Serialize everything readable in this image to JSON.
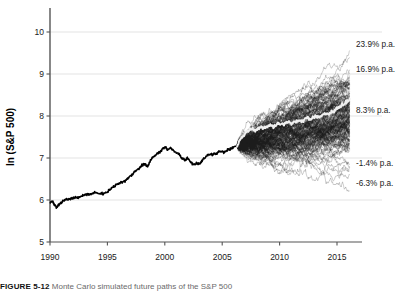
{
  "figure": {
    "caption_label": "FIGURE 5-12",
    "caption_text": "Monte Carlo simulated future paths of the S&P 500",
    "background_color": "#ffffff"
  },
  "chart_data": {
    "type": "line",
    "title": "",
    "subtitle": "",
    "xlabel": "",
    "ylabel": "ln (S&P 500)",
    "xlim": [
      1989.2,
      2016.6
    ],
    "ylim": [
      5,
      10.35
    ],
    "grid": true,
    "grid_axis": "y",
    "legend_position": "none",
    "yticks": [
      5,
      6,
      7,
      8,
      9,
      10
    ],
    "ytick_labels": [
      "5",
      "6",
      "7",
      "8",
      "9",
      "10"
    ],
    "xticks": [
      1990,
      1995,
      2000,
      2005,
      2010,
      2015
    ],
    "xtick_labels": [
      "1990",
      "1995",
      "2000",
      "2005",
      "2010",
      "2015"
    ],
    "colors": {
      "historical_line": "#000000",
      "simulation_path": "#1d1d1d",
      "median_path": "#efefef",
      "grid": "#dcdcdc",
      "axis": "#555555",
      "text": "#1a1a1a"
    },
    "series": [
      {
        "name": "Historical ln(S&P 500)",
        "kind": "historical",
        "color": "#000000",
        "line_width": 1.6,
        "x_start": 1990.0,
        "x_end": 2006.3,
        "x": [
          1990.0,
          1990.2,
          1990.4,
          1990.6,
          1990.8,
          1991.0,
          1991.25,
          1991.5,
          1991.75,
          1992.0,
          1992.25,
          1992.5,
          1992.75,
          1993.0,
          1993.25,
          1993.5,
          1993.75,
          1994.0,
          1994.25,
          1994.5,
          1994.75,
          1995.0,
          1995.25,
          1995.5,
          1995.75,
          1996.0,
          1996.25,
          1996.5,
          1996.75,
          1997.0,
          1997.25,
          1997.5,
          1997.75,
          1998.0,
          1998.25,
          1998.5,
          1998.75,
          1999.0,
          1999.25,
          1999.5,
          1999.75,
          2000.0,
          2000.25,
          2000.5,
          2000.75,
          2001.0,
          2001.25,
          2001.5,
          2001.75,
          2002.0,
          2002.25,
          2002.5,
          2002.75,
          2003.0,
          2003.25,
          2003.5,
          2003.75,
          2004.0,
          2004.25,
          2004.5,
          2004.75,
          2005.0,
          2005.25,
          2005.5,
          2005.75,
          2006.0,
          2006.3
        ],
        "y": [
          5.93,
          5.96,
          5.88,
          5.83,
          5.9,
          5.95,
          5.99,
          6.01,
          6.02,
          6.05,
          6.07,
          6.06,
          6.09,
          6.11,
          6.13,
          6.14,
          6.16,
          6.17,
          6.15,
          6.16,
          6.15,
          6.2,
          6.26,
          6.31,
          6.35,
          6.39,
          6.42,
          6.44,
          6.5,
          6.56,
          6.63,
          6.72,
          6.74,
          6.82,
          6.86,
          6.8,
          6.94,
          7.02,
          7.09,
          7.12,
          7.2,
          7.26,
          7.21,
          7.24,
          7.18,
          7.13,
          7.09,
          7.0,
          6.94,
          7.0,
          6.9,
          6.83,
          6.87,
          6.85,
          6.94,
          7.01,
          7.07,
          7.09,
          7.08,
          7.1,
          7.15,
          7.16,
          7.15,
          7.19,
          7.22,
          7.26,
          7.3
        ]
      },
      {
        "name": "Monte Carlo simulated paths",
        "kind": "simulation_fan",
        "color": "#1d1d1d",
        "line_width": 0.35,
        "opacity": 0.62,
        "n_paths": 160,
        "x_start": 2006.3,
        "x_end": 2016.1,
        "start_value": 7.3,
        "steps_per_year": 26,
        "drift_per_year": 0.0795,
        "volatility_per_year": 0.163
      },
      {
        "name": "Median simulated path",
        "kind": "median",
        "color": "#efefef",
        "line_width": 2.0,
        "x_start": 2006.3,
        "x_end": 2016.1,
        "x": [
          2006.3,
          2006.7,
          2007.1,
          2007.5,
          2007.9,
          2008.3,
          2008.7,
          2009.1,
          2009.5,
          2009.9,
          2010.3,
          2010.7,
          2011.1,
          2011.5,
          2011.9,
          2012.3,
          2012.7,
          2013.1,
          2013.5,
          2013.9,
          2014.3,
          2014.7,
          2015.1,
          2015.5,
          2015.8,
          2016.1
        ],
        "y": [
          7.3,
          7.5,
          7.62,
          7.7,
          7.66,
          7.74,
          7.71,
          7.79,
          7.75,
          7.83,
          7.8,
          7.86,
          7.83,
          7.9,
          7.88,
          7.96,
          7.92,
          8.0,
          7.98,
          8.06,
          8.04,
          8.12,
          8.18,
          8.26,
          8.34,
          8.4
        ]
      }
    ],
    "annotations": [
      {
        "id": "upper-extreme",
        "text": "23.9% p.a.",
        "x": 2016.1,
        "y": 9.55,
        "label_y_px": 47,
        "align": "left"
      },
      {
        "id": "upper-band",
        "text": "16.9% p.a.",
        "x": 2016.1,
        "y": 9.13,
        "label_y_px": 72,
        "align": "left"
      },
      {
        "id": "median-band",
        "text": "8.3% p.a.",
        "x": 2016.1,
        "y": 8.4,
        "label_y_px": 113,
        "align": "left"
      },
      {
        "id": "lower-band",
        "text": "-1.4% p.a.",
        "x": 2016.1,
        "y": 7.17,
        "label_y_px": 166,
        "align": "left"
      },
      {
        "id": "lower-extreme",
        "text": "-6.3% p.a.",
        "x": 2016.1,
        "y": 6.97,
        "label_y_px": 186,
        "align": "left"
      }
    ]
  }
}
